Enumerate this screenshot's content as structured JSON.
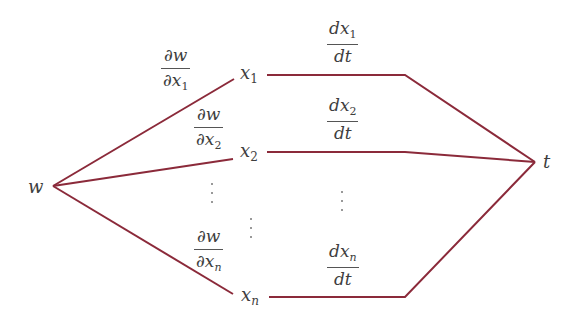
{
  "diagram": {
    "type": "tree-diagram-chain-rule",
    "line_color": "#8b2a3a",
    "root": {
      "label": "w"
    },
    "terminal": {
      "label": "t"
    },
    "nodes": [
      {
        "var": "x",
        "sub": "1",
        "sub_italic": false,
        "left_edge": {
          "num_d": "∂",
          "num_var": "w",
          "den_d": "∂",
          "den_var": "x",
          "den_sub": "1"
        },
        "right_edge": {
          "num_d": "d",
          "num_var": "x",
          "num_sub": "1",
          "den": "dt"
        }
      },
      {
        "var": "x",
        "sub": "2",
        "sub_italic": false,
        "left_edge": {
          "num_d": "∂",
          "num_var": "w",
          "den_d": "∂",
          "den_var": "x",
          "den_sub": "2"
        },
        "right_edge": {
          "num_d": "d",
          "num_var": "x",
          "num_sub": "2",
          "den": "dt"
        }
      },
      {
        "var": "x",
        "sub": "n",
        "sub_italic": true,
        "left_edge": {
          "num_d": "∂",
          "num_var": "w",
          "den_d": "∂",
          "den_var": "x",
          "den_sub": "n"
        },
        "right_edge": {
          "num_d": "d",
          "num_var": "x",
          "num_sub": "n",
          "den": "dt"
        }
      }
    ],
    "ellipsis": "⋮"
  }
}
